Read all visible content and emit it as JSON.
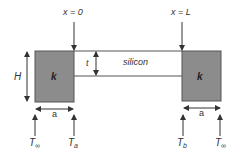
{
  "diagram": {
    "labels": {
      "x0": "x = 0",
      "xL": "x = L",
      "height": "H",
      "thickness": "t",
      "strip": "silicon",
      "left_block_k": "k",
      "right_block_k": "k",
      "left_width": "a",
      "right_width": "a",
      "T_inf_left_main": "T",
      "T_inf_left_sub": "∞",
      "T_a_main": "T",
      "T_a_sub": "a",
      "T_b_main": "T",
      "T_b_sub": "b",
      "T_inf_right_main": "T",
      "T_inf_right_sub": "∞"
    },
    "colors": {
      "block_fill": "#8c8c8c",
      "line": "#333333",
      "background": "#ffffff"
    }
  }
}
